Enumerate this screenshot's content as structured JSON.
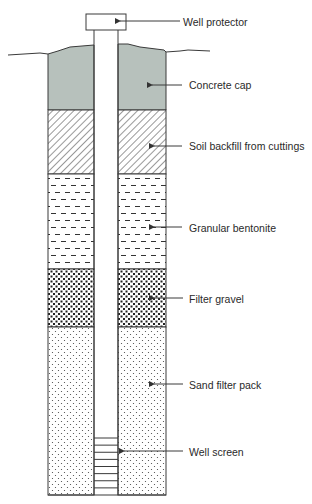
{
  "diagram": {
    "colors": {
      "line": "#3a3a3a",
      "concrete": "#b7c1bc",
      "background": "#ffffff",
      "pattern": "#333333"
    },
    "geometry": {
      "left_wall_x": 48,
      "casing_left_x": 94,
      "casing_right_x": 118,
      "right_wall_x": 166,
      "bottom_y": 495
    },
    "well_protector": {
      "x": 86,
      "y": 14,
      "width": 40,
      "height": 16
    },
    "ground_line": {
      "left": [
        [
          8,
          55
        ],
        [
          40,
          53
        ],
        [
          48,
          54
        ]
      ],
      "right": [
        [
          166,
          52
        ],
        [
          180,
          51
        ],
        [
          188,
          50
        ],
        [
          210,
          51
        ]
      ]
    },
    "layers": [
      {
        "id": "concrete",
        "label": "Concrete cap",
        "top": 46,
        "bottom": 110,
        "pattern": "solid"
      },
      {
        "id": "soil",
        "label": "Soil backfill from cuttings",
        "top": 110,
        "bottom": 174,
        "pattern": "hatch"
      },
      {
        "id": "bentonite",
        "label": "Granular bentonite",
        "top": 174,
        "bottom": 269,
        "pattern": "dashes"
      },
      {
        "id": "gravel",
        "label": "Filter gravel",
        "top": 269,
        "bottom": 327,
        "pattern": "gravel"
      },
      {
        "id": "sand",
        "label": "Sand filter pack",
        "top": 327,
        "bottom": 495,
        "pattern": "dots"
      }
    ],
    "well_screen": {
      "label": "Well screen",
      "top": 438,
      "bottom": 495,
      "slots": 8
    },
    "callouts": [
      {
        "label": "Well protector",
        "text_x": 183,
        "text_y": 16,
        "line_from_x": 180,
        "arrow_to_x": 116,
        "y": 21
      },
      {
        "label": "Concrete cap",
        "text_x": 189,
        "text_y": 79,
        "line_from_x": 182,
        "arrow_to_x": 148,
        "y": 85
      },
      {
        "label": "Soil backfill from cuttings",
        "text_x": 189,
        "text_y": 140,
        "line_from_x": 182,
        "arrow_to_x": 150,
        "y": 146
      },
      {
        "label": "Granular bentonite",
        "text_x": 189,
        "text_y": 222,
        "line_from_x": 182,
        "arrow_to_x": 150,
        "y": 227
      },
      {
        "label": "Filter gravel",
        "text_x": 189,
        "text_y": 293,
        "line_from_x": 183,
        "arrow_to_x": 150,
        "y": 298
      },
      {
        "label": "Sand filter pack",
        "text_x": 189,
        "text_y": 379,
        "line_from_x": 183,
        "arrow_to_x": 150,
        "y": 384
      },
      {
        "label": "Well screen",
        "text_x": 189,
        "text_y": 446,
        "line_from_x": 183,
        "arrow_to_x": 120,
        "y": 451
      }
    ]
  }
}
